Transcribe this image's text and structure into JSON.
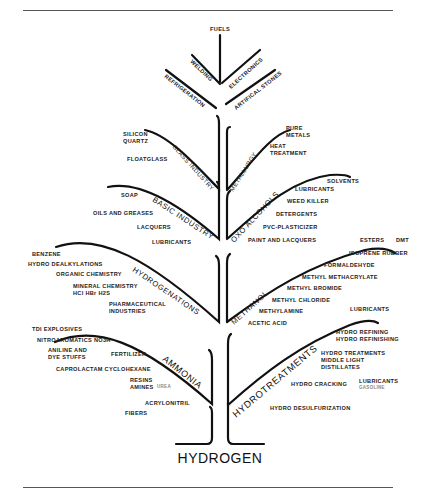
{
  "diagram": {
    "root": "HYDROGEN",
    "top": {
      "center": "FUELS",
      "left": [
        "WELDING",
        "REFRIGERATION"
      ],
      "right": [
        "ELECTRONICS",
        "ARTIFICAL STONES"
      ]
    },
    "branches": {
      "glass_industry": {
        "name": "GLASS INDUSTRY",
        "items": [
          "SILICON",
          "QUARTZ",
          "FLOATGLASS"
        ]
      },
      "metallurgy": {
        "name": "METALLURGY",
        "items": [
          "PURE",
          "METALS",
          "HEAT",
          "TREATMENT"
        ]
      },
      "basic_industry": {
        "name": "BASIC INDUSTRY",
        "items": [
          "SOAP",
          "OILS AND GREASES",
          "LACQUERS",
          "LUBRICANTS"
        ]
      },
      "oxo_alcohols": {
        "name": "OXO ALCOHOLS",
        "items": [
          "SOLVENTS",
          "LUBRICANTS",
          "WEED KILLER",
          "DETERGENTS",
          "PVC-PLASTICIZER",
          "PAINT AND LACQUERS"
        ]
      },
      "hydrogenations": {
        "name": "HYDROGENATIONS",
        "items": [
          "BENZENE",
          "HYDRO DEALKYLATIONS",
          "ORGANIC CHEMISTRY",
          "MINERAL CHEMISTRY",
          "HCl HBr H2S",
          "PHARMACEUTICAL",
          "INDUSTRIES"
        ]
      },
      "methanol": {
        "name": "METHANOL",
        "items": [
          "ESTERS",
          "DMT",
          "ISOPRENE RUBBER",
          "FORMALDEHYDE",
          "METHYL METHACRYLATE",
          "METHYL BROMIDE",
          "METHYL CHLORIDE",
          "METHYLAMINE",
          "ACETIC ACID",
          "LUBRICANTS"
        ]
      },
      "ammonia": {
        "name": "AMMONIA",
        "items": [
          "TDI EXPLOSIVES",
          "NITROAROMATICS NO3H",
          "ANILINE AND",
          "DYE STUFFS",
          "FERTILIZER",
          "CAPROLACTAM CYCLOHEXANE",
          "RESINS",
          "AMINES",
          "UREA",
          "ACRYLONITRIL",
          "FIBERS"
        ]
      },
      "hydrotreatments": {
        "name": "HYDROTREATMENTS",
        "items": [
          "HYDRO REFINING",
          "HYDRO REFINISHING",
          "HYDRO TREATMENTS",
          "MIDDLE LIGHT",
          "DISTILLATES",
          "HYDRO CRACKING",
          "LUBRICANTS",
          "GASOLINE",
          "HYDRO DESULFURIZATION"
        ]
      }
    }
  }
}
